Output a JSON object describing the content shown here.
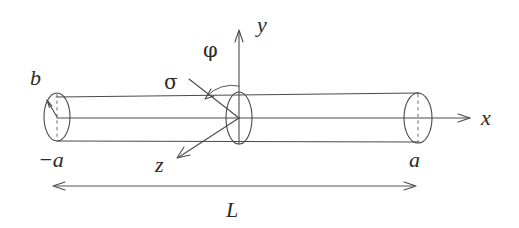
{
  "figure": {
    "background_color": "#ffffff",
    "line_color": "#4a4a4a",
    "text_color": "#2b2b2b"
  },
  "labels": {
    "y_axis": "y",
    "x_axis": "x",
    "z_axis": "z",
    "phi": "φ",
    "sigma": "σ",
    "radius_b": "b",
    "left_end": "−a",
    "right_end": "a",
    "length": "L"
  },
  "geometry": {
    "cylinder": {
      "left_center_x": 57,
      "right_center_x": 418,
      "axis_y": 118,
      "radius_y": 24,
      "radius_x": 13,
      "top_left_y": 97,
      "top_right_y": 93,
      "bottom_left_y": 141,
      "bottom_right_y": 142
    },
    "center_disc": {
      "center_x": 239,
      "center_y": 118,
      "radius_x": 13,
      "radius_y": 26
    },
    "axes": {
      "y_tip_x": 239,
      "y_tip_y": 30,
      "x_tip_x": 470,
      "x_tip_y": 118,
      "z_tip_x": 177,
      "z_tip_y": 158
    },
    "dimension_line": {
      "left_x": 53,
      "right_x": 416,
      "y": 186
    }
  }
}
